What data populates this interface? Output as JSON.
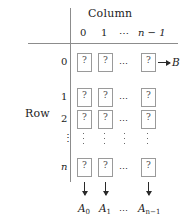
{
  "figure": {
    "column_axis_title": "Column",
    "row_axis_title": "Row",
    "column_headers": [
      "0",
      "1",
      "⋯",
      "n − 1"
    ],
    "row_headers": [
      "0",
      "1",
      "2",
      "⋮",
      "n"
    ],
    "cell_value": "?",
    "horizontal_ellipsis": "⋯",
    "row_result_label": "B",
    "column_result_labels": [
      "A",
      "A",
      "⋯",
      "A"
    ],
    "column_result_subscripts": [
      "0",
      "1",
      "",
      "n−1"
    ],
    "colors": {
      "background": "#ffffff",
      "rule": "#8c8c8c",
      "cell_border": "#9a9a9a",
      "text": "#1c1c1c",
      "cell_text": "#4a4a4a",
      "arrow": "#2a2a2a"
    }
  }
}
